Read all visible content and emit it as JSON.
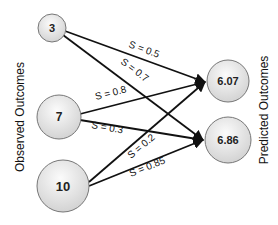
{
  "diagram": {
    "left_axis_label": "Observed Outcomes",
    "right_axis_label": "Predicted Outcomes",
    "observed_nodes": [
      {
        "id": "obs-3",
        "label": "3"
      },
      {
        "id": "obs-7",
        "label": "7"
      },
      {
        "id": "obs-10",
        "label": "10"
      }
    ],
    "predicted_nodes": [
      {
        "id": "pred-607",
        "label": "6.07"
      },
      {
        "id": "pred-686",
        "label": "6.86"
      }
    ],
    "edges": [
      {
        "from": "3",
        "to": "6.07",
        "label": "S = 0.5"
      },
      {
        "from": "3",
        "to": "6.86",
        "label": "S = 0.7"
      },
      {
        "from": "7",
        "to": "6.07",
        "label": "S = 0.8"
      },
      {
        "from": "7",
        "to": "6.86",
        "label": "S = 0.3"
      },
      {
        "from": "10",
        "to": "6.07",
        "label": "S = 0.2"
      },
      {
        "from": "10",
        "to": "6.86",
        "label": "S = 0.85"
      }
    ],
    "colors": {
      "edge": "#111111",
      "node_fill_light": "#fafafa",
      "node_fill_dark": "#d4d4d4",
      "node_stroke": "#777777"
    }
  }
}
